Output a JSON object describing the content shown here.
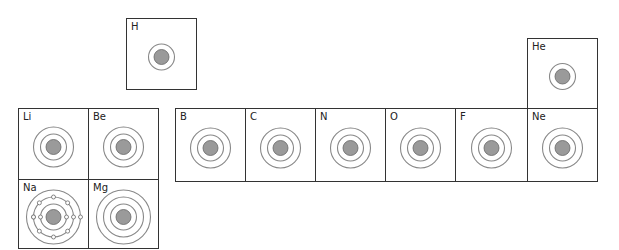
{
  "colors": {
    "nucleus": "#9a9a9a",
    "shell": "#888888",
    "border": "#333333",
    "electron": "#777777"
  },
  "elements": [
    {
      "symbol": "H",
      "shells": 1,
      "x": 126,
      "y": 18,
      "w": 71,
      "h": 72
    },
    {
      "symbol": "He",
      "shells": 1,
      "x": 527,
      "y": 38,
      "w": 71,
      "h": 71
    },
    {
      "symbol": "Li",
      "shells": 2,
      "x": 18,
      "y": 108,
      "w": 71,
      "h": 72
    },
    {
      "symbol": "Be",
      "shells": 2,
      "x": 88,
      "y": 108,
      "w": 71,
      "h": 72
    },
    {
      "symbol": "B",
      "shells": 2,
      "x": 175,
      "y": 108,
      "w": 71,
      "h": 74
    },
    {
      "symbol": "C",
      "shells": 2,
      "x": 245,
      "y": 108,
      "w": 71,
      "h": 74
    },
    {
      "symbol": "N",
      "shells": 2,
      "x": 315,
      "y": 108,
      "w": 71,
      "h": 74
    },
    {
      "symbol": "O",
      "shells": 2,
      "x": 385,
      "y": 108,
      "w": 71,
      "h": 74
    },
    {
      "symbol": "F",
      "shells": 2,
      "x": 455,
      "y": 108,
      "w": 73,
      "h": 74
    },
    {
      "symbol": "Ne",
      "shells": 2,
      "x": 527,
      "y": 108,
      "w": 71,
      "h": 74
    },
    {
      "symbol": "Na",
      "shells": 3,
      "x": 18,
      "y": 179,
      "w": 71,
      "h": 70,
      "electrons_shown": true
    },
    {
      "symbol": "Mg",
      "shells": 3,
      "x": 88,
      "y": 179,
      "w": 71,
      "h": 70
    }
  ]
}
